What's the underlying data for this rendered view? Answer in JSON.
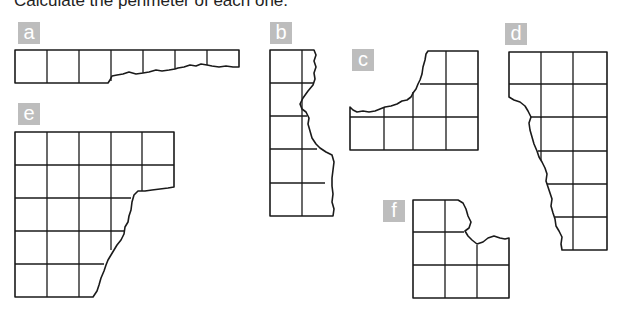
{
  "instruction": "Calculate the perimeter of each one.",
  "colors": {
    "label_bg": "#bdbdbd",
    "label_text": "#ffffff",
    "line": "#1a1a1a"
  },
  "shapes": [
    {
      "label": "a",
      "grid": "7 x 1 strip, right 4 squares torn along bottom edge"
    },
    {
      "label": "b",
      "grid": "2 x 5, right column torn along right edge"
    },
    {
      "label": "c",
      "grid": "4 columns, top-left portion torn away"
    },
    {
      "label": "d",
      "grid": "3 x 6, left side torn along diagonal"
    },
    {
      "label": "e",
      "grid": "5 x 5, bottom-right portion torn away"
    },
    {
      "label": "f",
      "grid": "3 x 3, top-right corner torn away"
    }
  ]
}
